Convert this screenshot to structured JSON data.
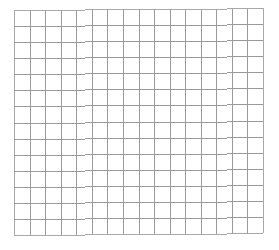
{
  "grid": {
    "columns": 16,
    "rows": 14,
    "line_color": "#9a9a9a",
    "border_color": "#a8a8a8",
    "background_color": "#ffffff"
  }
}
